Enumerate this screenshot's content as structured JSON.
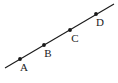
{
  "figure": {
    "type": "geometry-line-diagram",
    "width": 118,
    "height": 83,
    "background_color": "#ffffff",
    "ink_color": "#1a1a1a"
  },
  "line": {
    "name": "main-line",
    "x1": 5,
    "y1": 68,
    "x2": 114,
    "y2": 4,
    "stroke_width": 1.1,
    "description": "straight line rising from lower-left to upper-right"
  },
  "points": [
    {
      "label": "A",
      "dot_x": 20,
      "dot_y": 59,
      "dot_r": 1.9,
      "label_x": 24,
      "label_y": 71
    },
    {
      "label": "B",
      "dot_x": 44,
      "dot_y": 45,
      "dot_r": 1.9,
      "label_x": 48,
      "label_y": 57
    },
    {
      "label": "C",
      "dot_x": 70,
      "dot_y": 30,
      "dot_r": 1.9,
      "label_x": 75,
      "label_y": 42
    },
    {
      "label": "D",
      "dot_x": 96,
      "dot_y": 14,
      "dot_r": 1.9,
      "label_x": 100,
      "label_y": 26
    }
  ]
}
